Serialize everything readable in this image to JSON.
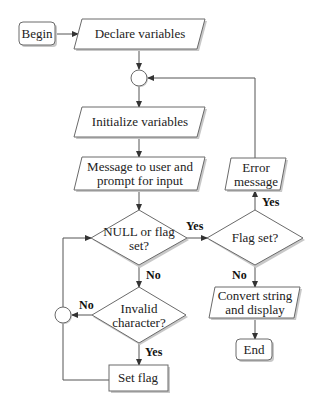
{
  "diagram": {
    "type": "flowchart",
    "nodes": {
      "begin": {
        "label": "Begin",
        "shape": "rounded-rect"
      },
      "declare": {
        "label": "Declare variables",
        "shape": "parallelogram"
      },
      "merge_top": {
        "label": "",
        "shape": "circle"
      },
      "initialize": {
        "label": "Initialize variables",
        "shape": "parallelogram"
      },
      "message": {
        "line1": "Message to user and",
        "line2": "prompt for input",
        "shape": "parallelogram"
      },
      "null_check": {
        "line1": "NULL or flag",
        "line2": "set?",
        "shape": "diamond"
      },
      "flag_check": {
        "label": "Flag set?",
        "shape": "diamond"
      },
      "error": {
        "line1": "Error",
        "line2": "message",
        "shape": "parallelogram"
      },
      "invalid_check": {
        "line1": "Invalid",
        "line2": "character?",
        "shape": "diamond"
      },
      "merge_left": {
        "label": "",
        "shape": "circle"
      },
      "set_flag": {
        "label": "Set flag",
        "shape": "rect"
      },
      "convert": {
        "line1": "Convert string",
        "line2": "and display",
        "shape": "parallelogram"
      },
      "end": {
        "label": "End",
        "shape": "rounded-rect"
      }
    },
    "edge_labels": {
      "null_yes": "Yes",
      "null_no": "No",
      "flag_yes": "Yes",
      "flag_no": "No",
      "invalid_no": "No",
      "invalid_yes": "Yes"
    },
    "edges": [
      [
        "begin",
        "declare"
      ],
      [
        "declare",
        "merge_top"
      ],
      [
        "merge_top",
        "initialize"
      ],
      [
        "initialize",
        "message"
      ],
      [
        "message",
        "null_check"
      ],
      [
        "null_check",
        "flag_check",
        "Yes"
      ],
      [
        "null_check",
        "invalid_check",
        "No"
      ],
      [
        "flag_check",
        "error",
        "Yes"
      ],
      [
        "flag_check",
        "convert",
        "No"
      ],
      [
        "error",
        "merge_top"
      ],
      [
        "invalid_check",
        "merge_left",
        "No"
      ],
      [
        "invalid_check",
        "set_flag",
        "Yes"
      ],
      [
        "set_flag",
        "merge_left"
      ],
      [
        "merge_left",
        "null_check"
      ],
      [
        "convert",
        "end"
      ]
    ]
  }
}
